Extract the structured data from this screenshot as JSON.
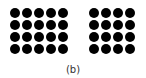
{
  "figure": {
    "caption": "(b)",
    "dot_color": "#000000",
    "left_grid": {
      "rows": 4,
      "cols": 5,
      "count": 20
    },
    "right_grid": {
      "rows": 4,
      "cols": 4,
      "count": 16
    }
  }
}
